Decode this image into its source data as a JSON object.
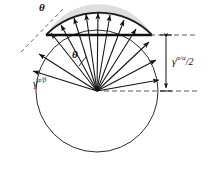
{
  "figure": {
    "type": "geometric-diagram",
    "background_color": "#ffffff",
    "stroke_color": "#1a1a1a",
    "cap_fill_color": "#dcdcdc",
    "circle": {
      "cx": 97,
      "cy": 91,
      "r": 61
    },
    "chord": {
      "y": 35,
      "x1": 46,
      "x2": 152,
      "style": "thick-solid"
    },
    "rays": {
      "count": 13,
      "origin": [
        97,
        91
      ],
      "arrowheads": true,
      "note": "vectors fan from the centre; upper ones terminate on the cap arc, lower ones on the circle"
    },
    "labels": [
      {
        "name": "theta-outer",
        "text": "θ",
        "x": 41,
        "y": 6,
        "note": "angle between dashed tangent and cap arc at upper-left"
      },
      {
        "name": "theta-inner",
        "text": "θ",
        "x": 74,
        "y": 52,
        "note": "angle between a radial vector and the chord"
      },
      {
        "name": "gamma-alpha-beta",
        "base": "γ",
        "superscript": "α/β",
        "x": 36,
        "y": 80,
        "note": "radius of the full circle, interfacial energy alpha/beta"
      },
      {
        "name": "gamma-alpha-alpha-over-2",
        "base": "γ",
        "superscript": "α/α",
        "denominator": "2",
        "x": 172,
        "y": 58,
        "note": "vertical dimension from centre line to chord line"
      }
    ],
    "dimension": {
      "name": "vertical-dimension-gamma-aa-2",
      "x": 166,
      "y_top": 35,
      "y_bottom": 91,
      "double_headed": true
    },
    "guides": [
      {
        "name": "dashed-guide-top",
        "from": [
          152,
          35
        ],
        "to": [
          196,
          35
        ],
        "style": "dashed"
      },
      {
        "name": "dashed-guide-bottom",
        "from": [
          110,
          91
        ],
        "to": [
          196,
          91
        ],
        "style": "dashed"
      },
      {
        "name": "dashed-tangent",
        "from": [
          22,
          50
        ],
        "to": [
          62,
          10
        ],
        "style": "dashed"
      }
    ]
  }
}
